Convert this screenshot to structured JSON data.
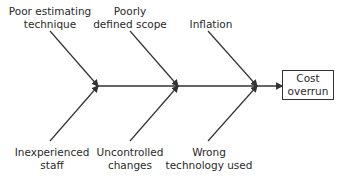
{
  "diagram": {
    "type": "fishbone",
    "effect": {
      "line1": "Cost",
      "line2": "overrun"
    },
    "causes_top": [
      {
        "line1": "Poor estimating",
        "line2": "technique"
      },
      {
        "line1": "Poorly",
        "line2": "defined scope"
      },
      {
        "line1": "Inflation",
        "line2": ""
      }
    ],
    "causes_bottom": [
      {
        "line1": "Inexperienced",
        "line2": "staff"
      },
      {
        "line1": "Uncontrolled",
        "line2": "changes"
      },
      {
        "line1": "Wrong",
        "line2": "technology used"
      }
    ],
    "line_color": "#333333"
  }
}
